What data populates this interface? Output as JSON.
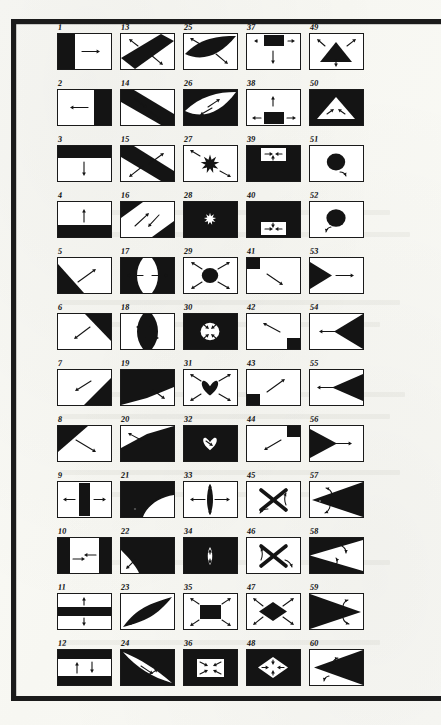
{
  "plate": {
    "title": "Plate of 60 figure-ground diagrams",
    "description": "Numbered rectangular panels, each containing a black/white shape with arrows indicating direction of movement or expansion.",
    "columns": 5,
    "rows": 12,
    "figure_count": 60,
    "ink_color": "#1a1a1a",
    "paper_color": "#fbfbf7"
  },
  "figures": [
    {
      "n": "1",
      "col": 0,
      "row": 0,
      "inverted": false,
      "shape": "half-left",
      "arrows": [
        "right"
      ]
    },
    {
      "n": "2",
      "col": 0,
      "row": 1,
      "inverted": false,
      "shape": "half-right",
      "arrows": [
        "left"
      ]
    },
    {
      "n": "3",
      "col": 0,
      "row": 2,
      "inverted": false,
      "shape": "half-top",
      "arrows": [
        "down"
      ]
    },
    {
      "n": "4",
      "col": 0,
      "row": 3,
      "inverted": false,
      "shape": "half-bottom",
      "arrows": [
        "up"
      ]
    },
    {
      "n": "5",
      "col": 0,
      "row": 4,
      "inverted": false,
      "shape": "tri-bottom-left",
      "arrows": [
        "up-right"
      ]
    },
    {
      "n": "6",
      "col": 0,
      "row": 5,
      "inverted": false,
      "shape": "tri-top-right",
      "arrows": [
        "down-left"
      ]
    },
    {
      "n": "7",
      "col": 0,
      "row": 6,
      "inverted": false,
      "shape": "tri-bottom-right",
      "arrows": [
        "up-left"
      ]
    },
    {
      "n": "8",
      "col": 0,
      "row": 7,
      "inverted": false,
      "shape": "tri-top-left",
      "arrows": [
        "down-right"
      ]
    },
    {
      "n": "9",
      "col": 0,
      "row": 8,
      "inverted": false,
      "shape": "band-vertical",
      "arrows": [
        "left",
        "right"
      ]
    },
    {
      "n": "10",
      "col": 0,
      "row": 9,
      "inverted": false,
      "shape": "bands-lr",
      "arrows": [
        "right",
        "left"
      ]
    },
    {
      "n": "11",
      "col": 0,
      "row": 10,
      "inverted": false,
      "shape": "band-horizontal",
      "arrows": [
        "up",
        "down"
      ]
    },
    {
      "n": "12",
      "col": 0,
      "row": 11,
      "inverted": false,
      "shape": "bands-tb",
      "arrows": [
        "up",
        "down"
      ]
    },
    {
      "n": "13",
      "col": 1,
      "row": 0,
      "inverted": false,
      "shape": "diag-band-nesw",
      "arrows": [
        "up-left",
        "down-right"
      ]
    },
    {
      "n": "14",
      "col": 1,
      "row": 1,
      "inverted": false,
      "shape": "diag-band-nesw-w",
      "arrows": [
        "down-right",
        "down-right"
      ]
    },
    {
      "n": "15",
      "col": 1,
      "row": 2,
      "inverted": false,
      "shape": "diag-band-nwse",
      "arrows": [
        "up-right",
        "down-left"
      ]
    },
    {
      "n": "16",
      "col": 1,
      "row": 3,
      "inverted": false,
      "shape": "diag-band-nwse-w",
      "arrows": [
        "up-right",
        "down-right"
      ]
    },
    {
      "n": "17",
      "col": 1,
      "row": 4,
      "inverted": false,
      "shape": "hourglass-black",
      "arrows": [
        "left",
        "right"
      ]
    },
    {
      "n": "18",
      "col": 1,
      "row": 5,
      "inverted": true,
      "shape": "hourglass-white",
      "arrows": [
        "left",
        "right"
      ]
    },
    {
      "n": "19",
      "col": 1,
      "row": 6,
      "inverted": false,
      "shape": "wedge-upper-left",
      "arrows": [
        "down-right"
      ]
    },
    {
      "n": "20",
      "col": 1,
      "row": 7,
      "inverted": false,
      "shape": "wedge-lower-right",
      "arrows": [
        "up-left"
      ]
    },
    {
      "n": "21",
      "col": 1,
      "row": 8,
      "inverted": true,
      "shape": "curve-black-mass",
      "arrows": [
        "up-right"
      ]
    },
    {
      "n": "22",
      "col": 1,
      "row": 9,
      "inverted": true,
      "shape": "curve-black-mass2",
      "arrows": [
        "down-left"
      ]
    },
    {
      "n": "23",
      "col": 1,
      "row": 10,
      "inverted": false,
      "shape": "lens-diagonal",
      "arrows": [
        "up-right",
        "down-left"
      ]
    },
    {
      "n": "24",
      "col": 1,
      "row": 11,
      "inverted": true,
      "shape": "lens-white-diag",
      "arrows": [
        "down-right",
        "up-right"
      ]
    },
    {
      "n": "25",
      "col": 2,
      "row": 0,
      "inverted": false,
      "shape": "lens-black-wide",
      "arrows": [
        "up-left",
        "down-right"
      ]
    },
    {
      "n": "26",
      "col": 2,
      "row": 1,
      "inverted": true,
      "shape": "lens-white-wide",
      "arrows": [
        "up-right",
        "down-left"
      ]
    },
    {
      "n": "27",
      "col": 2,
      "row": 2,
      "inverted": false,
      "shape": "star-black",
      "arrows": [
        "up-left",
        "down-right"
      ]
    },
    {
      "n": "28",
      "col": 2,
      "row": 3,
      "inverted": true,
      "shape": "star-white",
      "arrows": []
    },
    {
      "n": "29",
      "col": 2,
      "row": 4,
      "inverted": false,
      "shape": "circle-black",
      "arrows": [
        "up-left",
        "up-right",
        "down-left",
        "down-right"
      ]
    },
    {
      "n": "30",
      "col": 2,
      "row": 5,
      "inverted": true,
      "shape": "circle-white",
      "arrows": [
        "in-ul",
        "in-ur",
        "in-dl",
        "in-dr"
      ]
    },
    {
      "n": "31",
      "col": 2,
      "row": 6,
      "inverted": false,
      "shape": "heart-black",
      "arrows": [
        "up-left",
        "up-right",
        "down-left",
        "down-right"
      ]
    },
    {
      "n": "32",
      "col": 2,
      "row": 7,
      "inverted": true,
      "shape": "heart-white",
      "arrows": [
        "in"
      ]
    },
    {
      "n": "33",
      "col": 2,
      "row": 8,
      "inverted": false,
      "shape": "lens-vertical",
      "arrows": [
        "left",
        "right",
        "up",
        "down"
      ]
    },
    {
      "n": "34",
      "col": 2,
      "row": 9,
      "inverted": true,
      "shape": "lens-vert-white",
      "arrows": [
        "up",
        "down"
      ]
    },
    {
      "n": "35",
      "col": 2,
      "row": 10,
      "inverted": false,
      "shape": "rect-black",
      "arrows": [
        "up-left",
        "up-right",
        "down-left",
        "down-right"
      ]
    },
    {
      "n": "36",
      "col": 2,
      "row": 11,
      "inverted": true,
      "shape": "rect-white",
      "arrows": [
        "in-ul",
        "in-ur",
        "in-dl",
        "in-dr"
      ]
    },
    {
      "n": "37",
      "col": 3,
      "row": 0,
      "inverted": false,
      "shape": "tab-top-black",
      "arrows": [
        "down",
        "right"
      ]
    },
    {
      "n": "38",
      "col": 3,
      "row": 1,
      "inverted": false,
      "shape": "tab-bottom-black",
      "arrows": [
        "up",
        "left",
        "right"
      ]
    },
    {
      "n": "39",
      "col": 3,
      "row": 2,
      "inverted": true,
      "shape": "tab-top-white",
      "arrows": [
        "right",
        "left",
        "up"
      ]
    },
    {
      "n": "40",
      "col": 3,
      "row": 3,
      "inverted": true,
      "shape": "tab-bottom-white",
      "arrows": [
        "right",
        "left",
        "down"
      ]
    },
    {
      "n": "41",
      "col": 3,
      "row": 4,
      "inverted": false,
      "shape": "corner-tl",
      "arrows": [
        "down-right"
      ]
    },
    {
      "n": "42",
      "col": 3,
      "row": 5,
      "inverted": false,
      "shape": "corner-br",
      "arrows": [
        "up-left"
      ]
    },
    {
      "n": "43",
      "col": 3,
      "row": 6,
      "inverted": false,
      "shape": "corner-bl",
      "arrows": [
        "up-right"
      ]
    },
    {
      "n": "44",
      "col": 3,
      "row": 7,
      "inverted": false,
      "shape": "corner-tr",
      "arrows": [
        "down-left"
      ]
    },
    {
      "n": "45",
      "col": 3,
      "row": 8,
      "inverted": false,
      "shape": "cross-x",
      "arrows": [
        "curve-dl",
        "curve-ur"
      ]
    },
    {
      "n": "46",
      "col": 3,
      "row": 9,
      "inverted": false,
      "shape": "cross-x2",
      "arrows": [
        "curve-ul",
        "curve-dr"
      ]
    },
    {
      "n": "47",
      "col": 3,
      "row": 10,
      "inverted": false,
      "shape": "diamond-black",
      "arrows": [
        "up-left",
        "up-right",
        "down-left",
        "down-right"
      ]
    },
    {
      "n": "48",
      "col": 3,
      "row": 11,
      "inverted": true,
      "shape": "diamond-white",
      "arrows": [
        "in-l",
        "in-r",
        "in-u",
        "in-d"
      ]
    },
    {
      "n": "49",
      "col": 4,
      "row": 0,
      "inverted": false,
      "shape": "triangle-black",
      "arrows": [
        "up-left",
        "up-right",
        "down"
      ]
    },
    {
      "n": "50",
      "col": 4,
      "row": 1,
      "inverted": true,
      "shape": "triangle-white",
      "arrows": [
        "in-l",
        "in-r"
      ]
    },
    {
      "n": "51",
      "col": 4,
      "row": 2,
      "inverted": false,
      "shape": "disc-black",
      "arrows": [
        "curve-cw"
      ]
    },
    {
      "n": "52",
      "col": 4,
      "row": 3,
      "inverted": false,
      "shape": "disc-black-2",
      "arrows": [
        "curve-ccw"
      ]
    },
    {
      "n": "53",
      "col": 4,
      "row": 4,
      "inverted": false,
      "shape": "wedge-left-black",
      "arrows": [
        "right"
      ]
    },
    {
      "n": "54",
      "col": 4,
      "row": 5,
      "inverted": false,
      "shape": "wedge-right-black",
      "arrows": [
        "left"
      ]
    },
    {
      "n": "55",
      "col": 4,
      "row": 6,
      "inverted": false,
      "shape": "wedge-right-b2",
      "arrows": [
        "left"
      ]
    },
    {
      "n": "56",
      "col": 4,
      "row": 7,
      "inverted": false,
      "shape": "wedge-left-b2",
      "arrows": [
        "right"
      ]
    },
    {
      "n": "57",
      "col": 4,
      "row": 8,
      "inverted": false,
      "shape": "wedge-right-big",
      "arrows": [
        "curve-u",
        "curve-d"
      ]
    },
    {
      "n": "58",
      "col": 4,
      "row": 9,
      "inverted": true,
      "shape": "wedge-white-left",
      "arrows": [
        "curve-d",
        "curve-u"
      ]
    },
    {
      "n": "59",
      "col": 4,
      "row": 10,
      "inverted": false,
      "shape": "wedge-left-big",
      "arrows": [
        "curve-u",
        "curve-d"
      ]
    },
    {
      "n": "60",
      "col": 4,
      "row": 11,
      "inverted": false,
      "shape": "wedge-right-big2",
      "arrows": [
        "curve-d",
        "curve-u"
      ]
    }
  ]
}
